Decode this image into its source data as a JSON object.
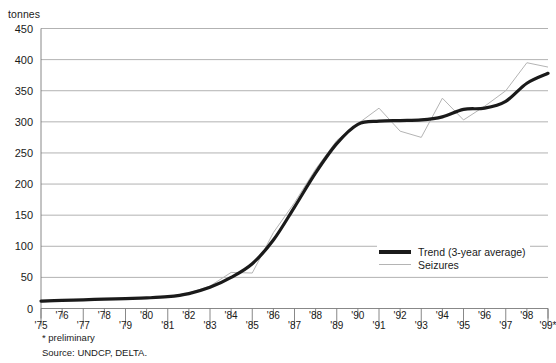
{
  "axis": {
    "unit_label": "tonnes",
    "y_ticks": [
      450,
      400,
      350,
      300,
      250,
      200,
      150,
      100,
      50,
      0
    ],
    "x_ticks": [
      "'75",
      "'76",
      "'77",
      "'78",
      "'79",
      "'80",
      "'81",
      "'82",
      "'83",
      "'84",
      "'85",
      "'86",
      "'87",
      "'88",
      "'89",
      "'90",
      "'91",
      "'92",
      "'93",
      "'94",
      "'95",
      "'96",
      "'97",
      "'98",
      "'99*"
    ]
  },
  "legend": {
    "trend_label": "Trend (3-year average)",
    "seizures_label": "Seizures"
  },
  "footnotes": {
    "preliminary": "* preliminary",
    "source": "Source: UNDCP, DELTA."
  },
  "colors": {
    "trend": "#1a1a1a",
    "seizures": "#b4b4b4",
    "gridline": "#a9a9a9",
    "axis": "#7a7a7a",
    "background": "#ffffff"
  },
  "chart_data": {
    "type": "line",
    "title": "",
    "subtitle": "",
    "xlabel": "",
    "ylabel": "tonnes",
    "ylim": [
      0,
      450
    ],
    "ytick_step": 50,
    "grid": true,
    "legend_position": "bottom-right",
    "x": [
      "'75",
      "'76",
      "'77",
      "'78",
      "'79",
      "'80",
      "'81",
      "'82",
      "'83",
      "'84",
      "'85",
      "'86",
      "'87",
      "'88",
      "'89",
      "'90",
      "'91",
      "'92",
      "'93",
      "'94",
      "'95",
      "'96",
      "'97",
      "'98",
      "'99*"
    ],
    "series": [
      {
        "name": "Trend (3-year average)",
        "style": "thick-black-smooth",
        "values": [
          12,
          13,
          14,
          15,
          16,
          17,
          19,
          24,
          34,
          50,
          72,
          110,
          163,
          218,
          265,
          296,
          301,
          302,
          303,
          308,
          320,
          322,
          333,
          362,
          378
        ]
      },
      {
        "name": "Seizures",
        "style": "thin-grey",
        "values": [
          10,
          13,
          14,
          15,
          16,
          17,
          19,
          25,
          36,
          58,
          57,
          122,
          170,
          224,
          270,
          297,
          322,
          285,
          275,
          338,
          303,
          325,
          350,
          395,
          388
        ]
      }
    ]
  }
}
